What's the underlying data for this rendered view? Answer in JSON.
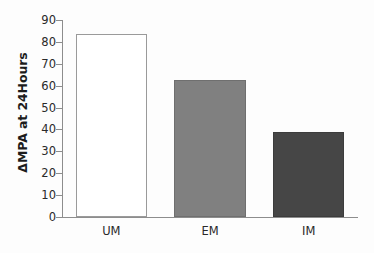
{
  "chart_data": {
    "type": "bar",
    "title": "",
    "xlabel": "",
    "ylabel": "ΔMPA at 24Hours",
    "categories": [
      "UM",
      "EM",
      "IM"
    ],
    "values": [
      83.5,
      62.5,
      39
    ],
    "series": [
      {
        "name": "ΔMPA at 24Hours",
        "values": [
          83.5,
          62.5,
          39
        ]
      }
    ],
    "ylim": [
      0,
      90
    ],
    "yticks": [
      0,
      10,
      20,
      30,
      40,
      50,
      60,
      70,
      80,
      90
    ],
    "ytick_labels": [
      "0",
      "10",
      "20",
      "30",
      "40",
      "50",
      "60",
      "70",
      "80",
      "90"
    ],
    "grid": false,
    "legend": false,
    "legend_position": "none",
    "bar_colors": [
      "#ffffff",
      "#808080",
      "#464646"
    ],
    "bar_edge_colors": [
      "#9a9a9a",
      "#6f6f6f",
      "#3c3c3c"
    ],
    "axis_color": "#8d8d8d",
    "background_color": "#fdfdfd"
  }
}
